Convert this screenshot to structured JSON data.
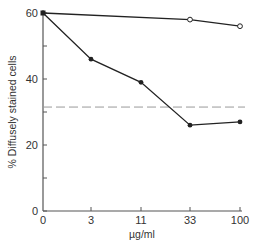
{
  "chart_data": {
    "type": "line",
    "title": "",
    "xlabel": "µg/ml",
    "ylabel": "% Diffusely stained cells",
    "x_scale": "categorical (log-spaced doses)",
    "categories": [
      "0",
      "3",
      "11",
      "33",
      "100"
    ],
    "ylim": [
      0,
      60
    ],
    "yticks": [
      0,
      20,
      40,
      60
    ],
    "y_minor_ticks": [
      10,
      30,
      50
    ],
    "grid": false,
    "legend": null,
    "series": [
      {
        "name": "filled circles",
        "marker": "filled-circle",
        "x": [
          "0",
          "3",
          "11",
          "33",
          "100"
        ],
        "values": [
          60,
          46,
          39,
          26,
          27
        ]
      },
      {
        "name": "open circles",
        "marker": "open-circle",
        "x": [
          "0",
          "33",
          "100"
        ],
        "values": [
          60,
          58,
          56
        ]
      }
    ],
    "reference_lines": [
      {
        "type": "horizontal",
        "style": "dashed",
        "value": 31.5
      }
    ]
  },
  "axes": {
    "x_title": "µg/ml",
    "y_title": "% Diffusely stained cells",
    "x_ticks": [
      "0",
      "3",
      "11",
      "33",
      "100"
    ],
    "y_ticks": [
      "0",
      "20",
      "40",
      "60"
    ]
  }
}
